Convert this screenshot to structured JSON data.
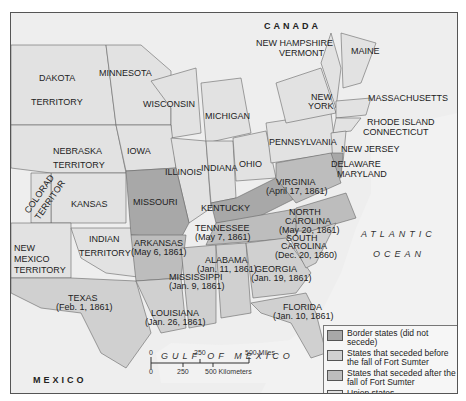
{
  "colors": {
    "border_states": "#a8a8a8",
    "seceded_before": "#d0d0d0",
    "seceded_after": "#bdbdbd",
    "union_states": "#e2e2e2",
    "water": "#f0f0f0",
    "foreign": "#eeeeee"
  },
  "countries": {
    "canada": "CANADA",
    "mexico": "MEXICO"
  },
  "water_bodies": {
    "atlantic_1": "ATLANTIC",
    "atlantic_2": "OCEAN",
    "gulf": "GULF OF MEXICO"
  },
  "regions": {
    "dakota_1": "DAKOTA",
    "dakota_2": "TERRITORY",
    "minnesota": "MINNESOTA",
    "wisconsin": "WISCONSIN",
    "michigan": "MICHIGAN",
    "new_hampshire": "NEW HAMPSHIRE",
    "vermont": "VERMONT",
    "maine": "MAINE",
    "new_york_1": "NEW",
    "new_york_2": "YORK",
    "massachusetts": "MASSACHUSETTS",
    "rhode_island": "RHODE ISLAND",
    "connecticut": "CONNECTICUT",
    "nebraska_1": "NEBRASKA",
    "nebraska_2": "TERRITORY",
    "iowa": "IOWA",
    "illinois": "ILLINOIS",
    "indiana": "INDIANA",
    "ohio": "OHIO",
    "pennsylvania": "PENNSYLVANIA",
    "new_jersey": "NEW JERSEY",
    "delaware": "DELAWARE",
    "maryland": "MARYLAND",
    "colorado_1": "COLORAD",
    "colorado_2": "TERRITOR",
    "kansas": "KANSAS",
    "missouri": "MISSOURI",
    "kentucky": "KENTUCKY",
    "virginia_1": "VIRGINIA",
    "virginia_2": "(April 17, 1861)",
    "north_carolina_1": "NORTH",
    "north_carolina_2": "CAROLINA",
    "north_carolina_3": "(May 20, 1861)",
    "tennessee_1": "TENNESSEE",
    "tennessee_2": "(May 7, 1861)",
    "new_mexico_1": "NEW",
    "new_mexico_2": "MEXICO",
    "new_mexico_3": "TERRITORY",
    "indian_1": "INDIAN",
    "indian_2": "TERRITORY",
    "arkansas_1": "ARKANSAS",
    "arkansas_2": "(May 6, 1861)",
    "south_carolina_1": "SOUTH",
    "south_carolina_2": "CAROLINA",
    "south_carolina_3": "(Dec. 20, 1860)",
    "alabama_1": "ALABAMA",
    "alabama_2": "(Jan. 11, 1861)",
    "georgia_1": "GEORGIA",
    "georgia_2": "(Jan. 19, 1861)",
    "mississippi_1": "MISSISSIPPI",
    "mississippi_2": "(Jan. 9, 1861)",
    "texas_1": "TEXAS",
    "texas_2": "(Feb. 1, 1861)",
    "louisiana_1": "LOUISIANA",
    "louisiana_2": "(Jan. 26, 1861)",
    "florida_1": "FLORIDA",
    "florida_2": "(Jan. 10, 1861)"
  },
  "legend": {
    "items": [
      {
        "label": "Border states (did not secede)"
      },
      {
        "label": "States that seceded before the fall of Fort Sumter"
      },
      {
        "label": "States that seceded after the fall of Fort Sumter"
      },
      {
        "label": "Union states"
      }
    ]
  },
  "scale": {
    "miles_ticks": [
      "0",
      "250",
      "500 Miles"
    ],
    "km_ticks": [
      "0",
      "250",
      "500 Kilometers"
    ]
  }
}
